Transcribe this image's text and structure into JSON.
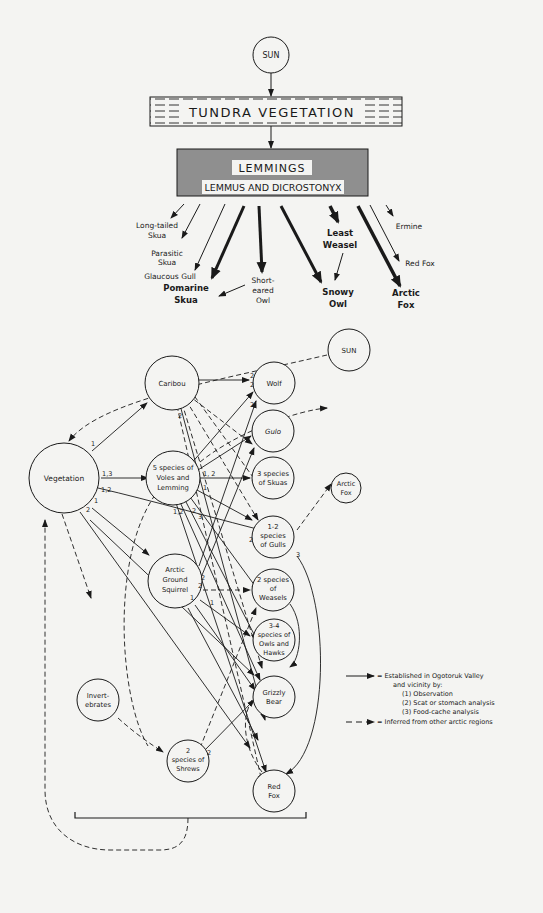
{
  "top_diagram": {
    "sun": "SUN",
    "vegetation": "TUNDRA VEGETATION",
    "lemmings_title": "LEMMINGS",
    "lemmings_subtitle": "LEMMUS AND DICROSTONYX",
    "predators": [
      {
        "id": "long-tailed-skua",
        "lines": [
          "Long-tailed",
          "Skua"
        ],
        "bold": false
      },
      {
        "id": "parasitic-skua",
        "lines": [
          "Parasitic",
          "Skua"
        ],
        "bold": false
      },
      {
        "id": "glaucous-gull",
        "lines": [
          "Glaucous Gull"
        ],
        "bold": false
      },
      {
        "id": "pomarine-skua",
        "lines": [
          "Pomarine",
          "Skua"
        ],
        "bold": true
      },
      {
        "id": "short-eared-owl",
        "lines": [
          "Short-",
          "eared",
          "Owl"
        ],
        "bold": false
      },
      {
        "id": "snowy-owl",
        "lines": [
          "Snowy",
          "Owl"
        ],
        "bold": true
      },
      {
        "id": "least-weasel",
        "lines": [
          "Least",
          "Weasel"
        ],
        "bold": true
      },
      {
        "id": "ermine",
        "lines": [
          "Ermine"
        ],
        "bold": false
      },
      {
        "id": "red-fox",
        "lines": [
          "Red Fox"
        ],
        "bold": false
      },
      {
        "id": "arctic-fox",
        "lines": [
          "Arctic",
          "Fox"
        ],
        "bold": true
      }
    ]
  },
  "bottom_diagram": {
    "nodes": {
      "sun": [
        "SUN"
      ],
      "vegetation": [
        "Vegetation"
      ],
      "caribou": [
        "Caribou"
      ],
      "voles": [
        "5 species of",
        "Voles and",
        "Lemming"
      ],
      "squirrel": [
        "Arctic",
        "Ground",
        "Squirrel"
      ],
      "invertebrates": [
        "Invert-",
        "ebrates"
      ],
      "shrews": [
        "2",
        "species of",
        "Shrews"
      ],
      "wolf": [
        "Wolf"
      ],
      "gulo": [
        "Gulo"
      ],
      "skuas": [
        "3 species",
        "of Skuas"
      ],
      "gulls": [
        "1-2",
        "species",
        "of Gulls"
      ],
      "weasels": [
        "2 species",
        "of",
        "Weasels"
      ],
      "owls": [
        "3-4",
        "species of",
        "Owls and",
        "Hawks"
      ],
      "bear": [
        "Grizzly",
        "Bear"
      ],
      "redfox": [
        "Red",
        "Fox"
      ],
      "arcticfox": [
        "Arctic",
        "Fox"
      ]
    },
    "edge_labels": {
      "veg_caribou": "1",
      "veg_voles": "1,3",
      "veg_gulls": "1,2",
      "veg_squirrel": "1",
      "veg_bear": "2",
      "caribou_wolf": "2",
      "caribou_down": "2",
      "voles_wolf": "2",
      "voles_arctic": "2",
      "voles_skuas": "1,  2",
      "voles_a": "1",
      "voles_b": "1,2",
      "voles_c": "2",
      "voles_d": "3",
      "gulls_in": "2",
      "gulls_out": "3",
      "squirrel_a": "2",
      "squirrel_b": "2",
      "squirrel_c": "1",
      "squirrel_d": "1",
      "shrews_out": "2"
    }
  },
  "legend": {
    "solid_line": "= Established in Ogotoruk Valley",
    "solid_line_2": "and vicinity by:",
    "methods": [
      "(1) Observation",
      "(2) Scat or stomach analysis",
      "(3) Food-cache analysis"
    ],
    "dashed_line": "= Inferred from other arctic regions"
  }
}
